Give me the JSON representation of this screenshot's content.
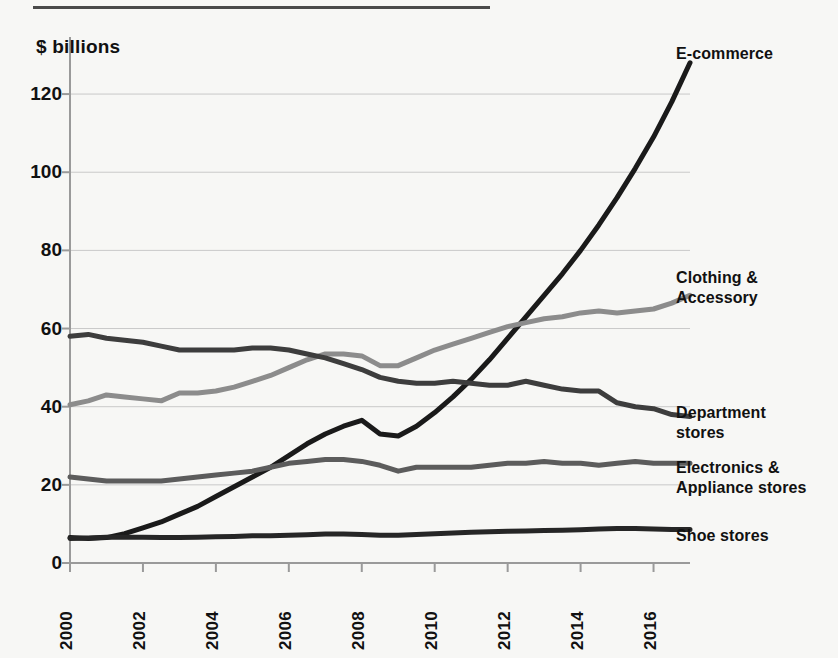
{
  "figure": {
    "unit_label": "$ billions",
    "top_rule": true
  },
  "chart_data": {
    "type": "line",
    "title": "",
    "subtitle": "",
    "xlabel": "",
    "ylabel": "$ billions",
    "ylim": [
      0,
      130
    ],
    "xlim": [
      2000,
      2017
    ],
    "grid": "horizontal",
    "legend_position": "right-inline-labels",
    "yticks": [
      0,
      20,
      40,
      60,
      80,
      100,
      120
    ],
    "ytick_labels": [
      "0",
      "20",
      "40",
      "60",
      "80",
      "100",
      "120"
    ],
    "xticks": [
      2000,
      2002,
      2004,
      2006,
      2008,
      2010,
      2012,
      2014,
      2016
    ],
    "xtick_labels": [
      "2000",
      "2002",
      "2004",
      "2006",
      "2008",
      "2010",
      "2012",
      "2014",
      "2016"
    ],
    "x": [
      2000,
      2000.5,
      2001,
      2001.5,
      2002,
      2002.5,
      2003,
      2003.5,
      2004,
      2004.5,
      2005,
      2005.5,
      2006,
      2006.5,
      2007,
      2007.5,
      2008,
      2008.5,
      2009,
      2009.5,
      2010,
      2010.5,
      2011,
      2011.5,
      2012,
      2012.5,
      2013,
      2013.5,
      2014,
      2014.5,
      2015,
      2015.5,
      2016,
      2016.5,
      2017
    ],
    "series": [
      {
        "name": "E-commerce",
        "label": "E-commerce",
        "color": "#1a1a1a",
        "width": 5,
        "label_pos": {
          "x": 676,
          "y": 44
        },
        "values": [
          6.5,
          6.3,
          6.5,
          7.5,
          9,
          10.5,
          12.5,
          14.5,
          17,
          19.5,
          22,
          24.5,
          27.5,
          30.5,
          33,
          35,
          36.5,
          33,
          32.5,
          35,
          38.5,
          42.5,
          47,
          52,
          57.5,
          63,
          68.5,
          74,
          80,
          86.5,
          93.5,
          101,
          109,
          118,
          128
        ]
      },
      {
        "name": "Clothing & Accessory",
        "label": "Clothing &\nAccessory",
        "color": "#8c8c8c",
        "width": 5,
        "label_pos": {
          "x": 676,
          "y": 268
        },
        "values": [
          40.5,
          41.5,
          43,
          42.5,
          42,
          41.5,
          43.5,
          43.5,
          44,
          45,
          46.5,
          48,
          50,
          52,
          53.5,
          53.5,
          53,
          50.5,
          50.5,
          52.5,
          54.5,
          56,
          57.5,
          59,
          60.5,
          61.5,
          62.5,
          63,
          64,
          64.5,
          64,
          64.5,
          65,
          66.5,
          68.5
        ]
      },
      {
        "name": "Department stores",
        "label": "Department\nstores",
        "color": "#3d3d3d",
        "width": 5,
        "label_pos": {
          "x": 676,
          "y": 403
        },
        "values": [
          58,
          58.5,
          57.5,
          57,
          56.5,
          55.5,
          54.5,
          54.5,
          54.5,
          54.5,
          55,
          55,
          54.5,
          53.5,
          52.5,
          51,
          49.5,
          47.5,
          46.5,
          46,
          46,
          46.5,
          46,
          45.5,
          45.5,
          46.5,
          45.5,
          44.5,
          44,
          44,
          41,
          40,
          39.5,
          38,
          37.5
        ]
      },
      {
        "name": "Electronics & Appliance stores",
        "label": "Electronics &\nAppliance stores",
        "color": "#5c5c5c",
        "width": 5,
        "label_pos": {
          "x": 676,
          "y": 458
        },
        "values": [
          22,
          21.5,
          21,
          21,
          21,
          21,
          21.5,
          22,
          22.5,
          23,
          23.5,
          24.5,
          25.5,
          26,
          26.5,
          26.5,
          26,
          25,
          23.5,
          24.5,
          24.5,
          24.5,
          24.5,
          25,
          25.5,
          25.5,
          26,
          25.5,
          25.5,
          25,
          25.5,
          26,
          25.5,
          25.5,
          25.5
        ]
      },
      {
        "name": "Shoe stores",
        "label": "Shoe stores",
        "color": "#262626",
        "width": 5,
        "label_pos": {
          "x": 676,
          "y": 526
        },
        "values": [
          6.3,
          6.4,
          6.6,
          6.6,
          6.6,
          6.5,
          6.5,
          6.6,
          6.7,
          6.8,
          7,
          7,
          7.1,
          7.2,
          7.4,
          7.4,
          7.3,
          7.1,
          7.1,
          7.3,
          7.5,
          7.7,
          7.9,
          8,
          8.1,
          8.2,
          8.3,
          8.4,
          8.5,
          8.7,
          8.8,
          8.8,
          8.7,
          8.6,
          8.6
        ]
      }
    ]
  },
  "colors": {
    "background": "#f7f7f5",
    "axis": "#9a9a9a",
    "gridline": "#c9c9c9",
    "text": "#111111",
    "rule": "#4a4a4a"
  }
}
